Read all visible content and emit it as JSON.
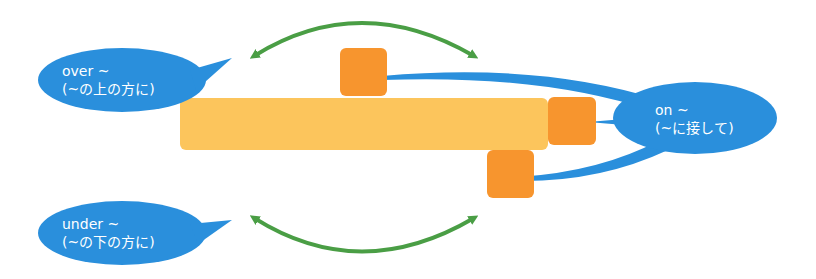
{
  "colors": {
    "bubble": "#2a8fdc",
    "bar": "#fcc55c",
    "box": "#f7952e",
    "arrow": "#4a9e45",
    "background": "#ffffff"
  },
  "bubbles": {
    "over": {
      "line1": "over ~",
      "line2": "(~の上の方に)"
    },
    "on": {
      "line1": "on ~",
      "line2": "(~に接して)"
    },
    "under": {
      "line1": "under ~",
      "line2": "(~の下の方に)"
    }
  }
}
